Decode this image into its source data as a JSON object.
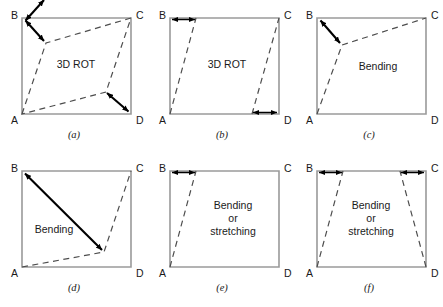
{
  "figure": {
    "rows": 2,
    "cols": 3,
    "colors": {
      "edge": "#9a9a9a",
      "dashed": "#4d4d4d",
      "arrow": "#000000",
      "text": "#1a1a1a",
      "background": "#ffffff"
    },
    "corner_labels": {
      "top_left": "B",
      "top_right": "C",
      "bottom_left": "A",
      "bottom_right": "D"
    }
  },
  "panels": [
    {
      "id": "a",
      "caption": "(a)",
      "mode_label": "3D ROT",
      "mode_lines": [
        "3D ROT"
      ],
      "description": "Square with interior quadrilateral rotated in 3D; double-headed arrows from corner B and to corner D",
      "corners": {
        "A": "A",
        "B": "B",
        "C": "C",
        "D": "D"
      },
      "arrow_count": 2,
      "arrow_style": "double-headed",
      "deformation": "3d-rotation"
    },
    {
      "id": "b",
      "caption": "(b)",
      "mode_label": "3D ROT",
      "mode_lines": [
        "3D ROT"
      ],
      "description": "Sheared parallelogram with horizontal double-headed arrows at top-left and bottom-right",
      "corners": {
        "A": "A",
        "B": "B",
        "C": "C",
        "D": "D"
      },
      "arrow_count": 2,
      "arrow_style": "double-headed",
      "deformation": "shear"
    },
    {
      "id": "c",
      "caption": "(c)",
      "mode_label": "Bending",
      "mode_lines": [
        "Bending"
      ],
      "description": "Square with dashed bent line from A to interior vertex to C; arrow from B to interior vertex",
      "corners": {
        "A": "A",
        "B": "B",
        "C": "C",
        "D": "D"
      },
      "arrow_count": 1,
      "arrow_style": "double-headed",
      "deformation": "bending"
    },
    {
      "id": "d",
      "caption": "(d)",
      "mode_label": "Bending",
      "mode_lines": [
        "Bending"
      ],
      "description": "Square with dashed line from A to interior point to C; long arrow from B to interior point",
      "corners": {
        "A": "A",
        "B": "B",
        "C": "C",
        "D": "D"
      },
      "arrow_count": 1,
      "arrow_style": "double-headed",
      "deformation": "bending"
    },
    {
      "id": "e",
      "caption": "(e)",
      "mode_label": "Bending or stretching",
      "mode_lines": [
        "Bending",
        "or",
        "stretching"
      ],
      "description": "Square with single dashed slanted line from A; horizontal double-headed arrow at top-left",
      "corners": {
        "A": "A",
        "B": "B",
        "C": "C",
        "D": "D"
      },
      "arrow_count": 1,
      "arrow_style": "double-headed",
      "deformation": "bending-or-stretching"
    },
    {
      "id": "f",
      "caption": "(f)",
      "mode_label": "Bending or stretching",
      "mode_lines": [
        "Bending",
        "or",
        "stretching"
      ],
      "description": "Symmetric trapezoid with inward horizontal double-headed arrows at both top corners",
      "corners": {
        "A": "A",
        "B": "B",
        "C": "C",
        "D": "D"
      },
      "arrow_count": 2,
      "arrow_style": "double-headed",
      "deformation": "bending-or-stretching"
    }
  ]
}
